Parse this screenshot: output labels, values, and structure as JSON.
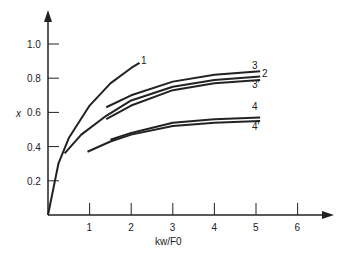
{
  "chart_data": {
    "type": "line",
    "title": "",
    "xlabel": "kw/F0",
    "ylabel": "x",
    "xlim": [
      0,
      6.5
    ],
    "ylim": [
      0,
      1.1
    ],
    "x_ticks": [
      "1",
      "2",
      "3",
      "4",
      "5",
      "6"
    ],
    "y_ticks": [
      "0.2",
      "0.4",
      "0.6",
      "0.8",
      "1.0"
    ],
    "grid": false,
    "series": [
      {
        "name": "1",
        "x": [
          0,
          0.25,
          0.5,
          1,
          1.5,
          2,
          2.2
        ],
        "values": [
          0,
          0.3,
          0.45,
          0.64,
          0.77,
          0.86,
          0.89
        ]
      },
      {
        "name": "2",
        "x": [
          0.4,
          0.8,
          1.4,
          2,
          3,
          4,
          5.1
        ],
        "values": [
          0.36,
          0.47,
          0.58,
          0.67,
          0.75,
          0.79,
          0.81
        ]
      },
      {
        "name": "3",
        "x": [
          1.4,
          2,
          3,
          4,
          5.1
        ],
        "values": [
          0.63,
          0.7,
          0.78,
          0.82,
          0.84
        ]
      },
      {
        "name": "3'",
        "x": [
          1.4,
          2,
          3,
          4,
          5.1
        ],
        "values": [
          0.56,
          0.64,
          0.73,
          0.77,
          0.79
        ]
      },
      {
        "name": "4",
        "x": [
          1.5,
          2,
          3,
          4,
          5.1
        ],
        "values": [
          0.44,
          0.48,
          0.54,
          0.56,
          0.57
        ]
      },
      {
        "name": "4'",
        "x": [
          0.95,
          1.5,
          2,
          3,
          4,
          5.1
        ],
        "values": [
          0.37,
          0.43,
          0.47,
          0.52,
          0.54,
          0.55
        ]
      }
    ]
  }
}
